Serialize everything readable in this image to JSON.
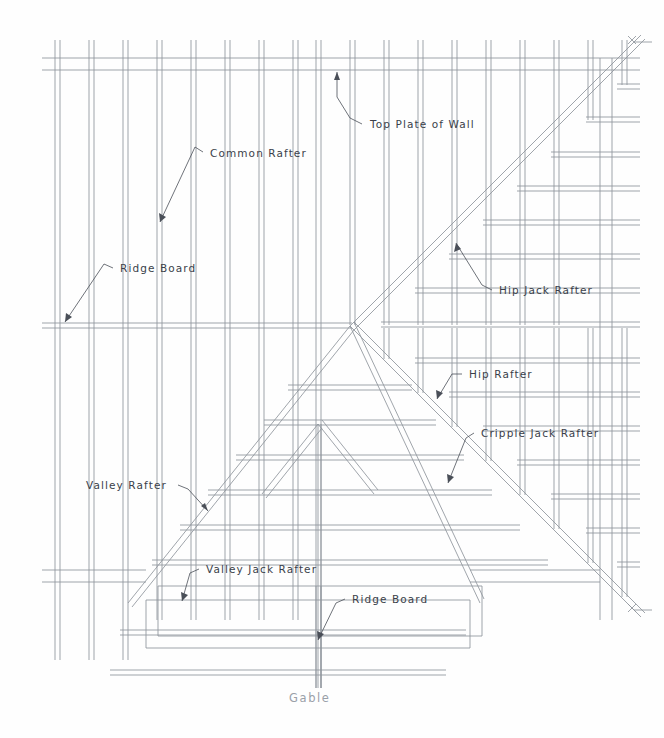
{
  "drawing": {
    "title": "Roof Framing Plan",
    "caption": "Gable",
    "stroke_color": "#8f959c",
    "text_color": "#3a3f4a",
    "caption_color": "#9aa0a8",
    "background": "#ffffff"
  },
  "labels": [
    {
      "id": "top-plate-of-wall",
      "text": "Top Plate of Wall",
      "x": 370,
      "y": 128,
      "leader": "M 362,124 L 350,118 L 337,97 L 337,72"
    },
    {
      "id": "common-rafter",
      "text": "Common Rafter",
      "x": 210,
      "y": 157,
      "leader": "M 203,152 L 195,147 L 160,222"
    },
    {
      "id": "ridge-board-upper",
      "text": "Ridge Board",
      "x": 120,
      "y": 272,
      "leader": "M 113,268 L 104,264 L 65,322"
    },
    {
      "id": "hip-jack-rafter",
      "text": "Hip Jack Rafter",
      "x": 499,
      "y": 294,
      "leader": "M 492,290 L 482,285 L 456,243"
    },
    {
      "id": "hip-rafter",
      "text": "Hip Rafter",
      "x": 469,
      "y": 378,
      "leader": "M 462,374 L 452,374 L 437,399"
    },
    {
      "id": "cripple-jack-rafter",
      "text": "Cripple Jack Rafter",
      "x": 481,
      "y": 437,
      "leader": "M 474,433 L 466,438 L 448,483"
    },
    {
      "id": "valley-rafter",
      "text": "Valley Rafter",
      "x": 86,
      "y": 489,
      "leader": "M 178,485 L 188,489 L 208,511"
    },
    {
      "id": "valley-jack-rafter",
      "text": "Valley Jack Rafter",
      "x": 206,
      "y": 573,
      "leader": "M 199,569 L 190,573 L 182,601"
    },
    {
      "id": "ridge-board-lower",
      "text": "Ridge Board",
      "x": 352,
      "y": 603,
      "leader": "M 345,599 L 336,603 L 318,640"
    }
  ],
  "geometry": {
    "common_rafter_count": 18,
    "common_rafter_spacing": 34,
    "hip_jack_count": 10,
    "valley_jack_count": 6,
    "member_width": 5,
    "top_plate_y": 58,
    "ridge_y": 325,
    "hip_node": {
      "x": 350,
      "y": 325
    },
    "lower_plate_y": 578
  }
}
